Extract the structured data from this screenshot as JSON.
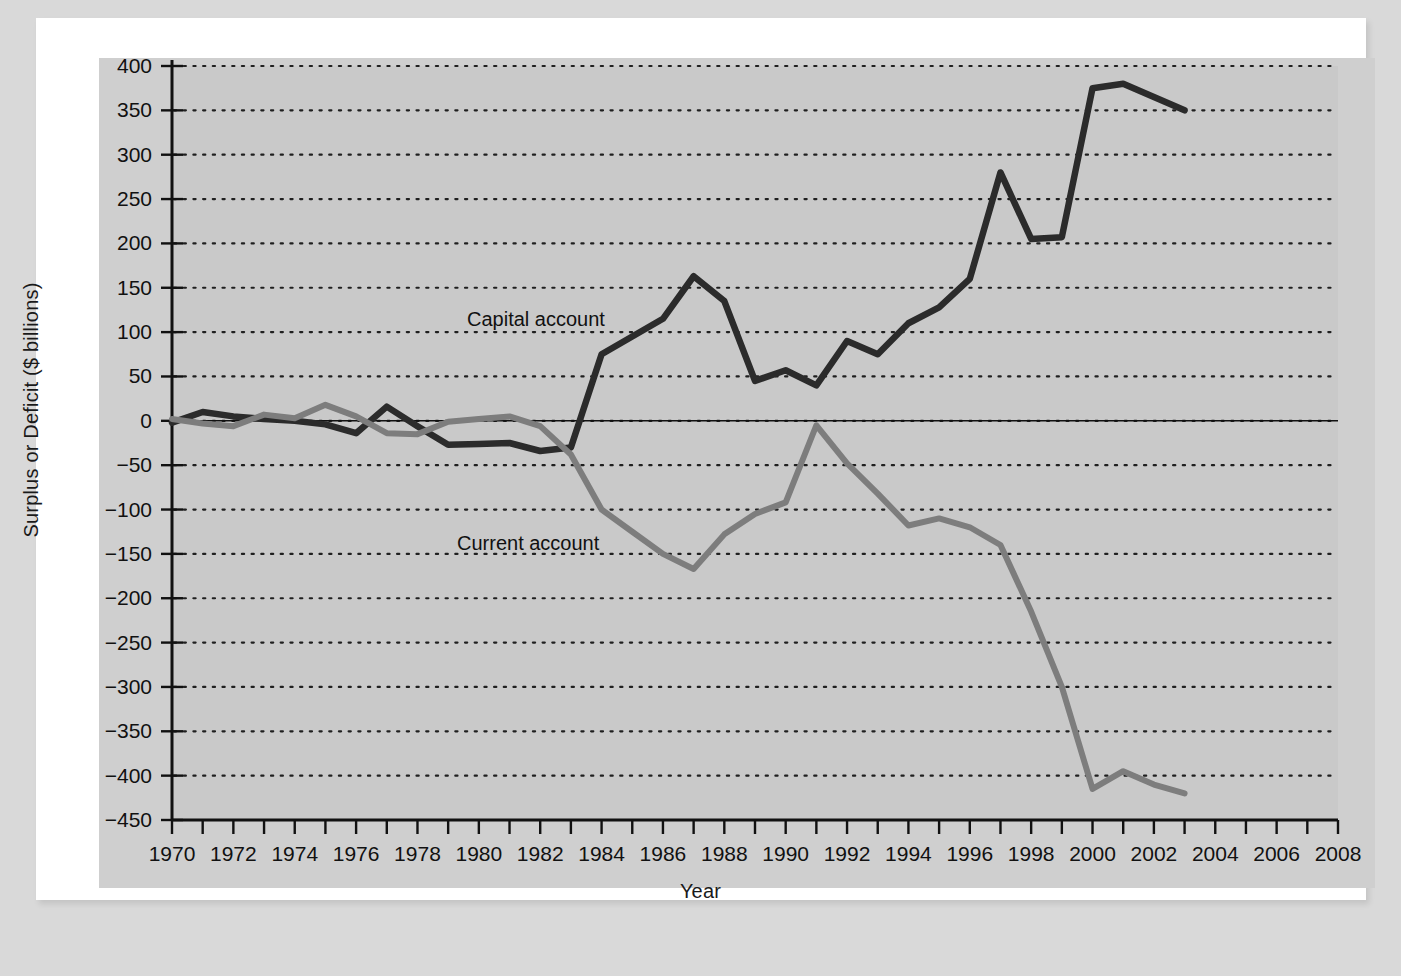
{
  "figure": {
    "background_color": "#d9d9d9",
    "panel_color": "#cfcfcf",
    "frame_color": "#ffffff"
  },
  "labels": {
    "ylabel": "Surplus or Deficit ($ billions)",
    "xlabel": "Year",
    "capital_series": "Capital account",
    "current_series": "Current account"
  },
  "chart_data": {
    "type": "line",
    "title": "",
    "xlabel": "Year",
    "ylabel": "Surplus or Deficit ($ billions)",
    "xlim": [
      1970,
      2008
    ],
    "ylim": [
      -450,
      400
    ],
    "yticks": [
      400,
      350,
      300,
      250,
      200,
      150,
      100,
      50,
      0,
      -50,
      -100,
      -150,
      -200,
      -250,
      -300,
      -350,
      -400,
      -450
    ],
    "ytick_labels": [
      "400",
      "350",
      "300",
      "250",
      "200",
      "150",
      "100",
      "50",
      "0",
      "−50",
      "−100",
      "−150",
      "−200",
      "−250",
      "−300",
      "−350",
      "−400",
      "−450"
    ],
    "xticks": [
      1970,
      1971,
      1972,
      1973,
      1974,
      1975,
      1976,
      1977,
      1978,
      1979,
      1980,
      1981,
      1982,
      1983,
      1984,
      1985,
      1986,
      1987,
      1988,
      1989,
      1990,
      1991,
      1992,
      1993,
      1994,
      1995,
      1996,
      1997,
      1998,
      1999,
      2000,
      2001,
      2002,
      2003,
      2004,
      2005,
      2006,
      2007,
      2008
    ],
    "xtick_labels_shown": [
      "1970",
      "1972",
      "1974",
      "1976",
      "1978",
      "1980",
      "1982",
      "1984",
      "1986",
      "1988",
      "1990",
      "1992",
      "1994",
      "1996",
      "1998",
      "2000",
      "2002",
      "2004",
      "2006",
      "2008"
    ],
    "grid": "horizontal dotted gridlines at every y tick",
    "legend": "inline series labels on plot",
    "zero_line": true,
    "series": [
      {
        "name": "Capital account",
        "color": "#2b2b2b",
        "x": [
          1970,
          1971,
          1972,
          1973,
          1974,
          1975,
          1976,
          1977,
          1978,
          1979,
          1980,
          1981,
          1982,
          1983,
          1984,
          1985,
          1986,
          1987,
          1988,
          1989,
          1990,
          1991,
          1992,
          1993,
          1994,
          1995,
          1996,
          1997,
          1998,
          1999,
          2000,
          2001,
          2002,
          2003
        ],
        "values": [
          -2,
          10,
          5,
          2,
          0,
          -4,
          -14,
          16,
          -6,
          -27,
          -26,
          -25,
          -34,
          -30,
          75,
          95,
          115,
          163,
          135,
          45,
          57,
          40,
          90,
          75,
          110,
          128,
          160,
          280,
          205,
          207,
          375,
          380,
          365,
          350
        ]
      },
      {
        "name": "Current account",
        "color": "#7d7d7d",
        "x": [
          1970,
          1971,
          1972,
          1973,
          1974,
          1975,
          1976,
          1977,
          1978,
          1979,
          1980,
          1981,
          1982,
          1983,
          1984,
          1985,
          1986,
          1987,
          1988,
          1989,
          1990,
          1991,
          1992,
          1993,
          1994,
          1995,
          1996,
          1997,
          1998,
          1999,
          2000,
          2001,
          2002,
          2003
        ],
        "values": [
          2,
          -3,
          -6,
          7,
          3,
          18,
          5,
          -14,
          -15,
          -1,
          2,
          5,
          -6,
          -38,
          -100,
          -125,
          -150,
          -167,
          -128,
          -105,
          -92,
          -5,
          -48,
          -82,
          -118,
          -110,
          -120,
          -140,
          -215,
          -300,
          -415,
          -395,
          -410,
          -420
        ]
      }
    ]
  }
}
